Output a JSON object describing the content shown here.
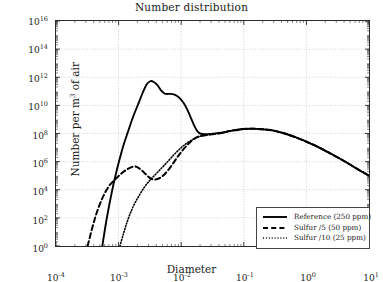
{
  "chart_data": {
    "type": "line",
    "title": "Number distribution",
    "xlabel": "Diameter",
    "ylabel_prefix": "Number per m",
    "ylabel_exponent": "3",
    "ylabel_suffix": " of air",
    "xscale": "log",
    "yscale": "log",
    "xlim": [
      0.0001,
      10
    ],
    "ylim": [
      1,
      1e+16
    ],
    "grid": true,
    "legend_position": "lower right",
    "xticks": [
      {
        "value": 0.0001,
        "mantissa": "10",
        "exponent": "-4"
      },
      {
        "value": 0.001,
        "mantissa": "10",
        "exponent": "-3"
      },
      {
        "value": 0.01,
        "mantissa": "10",
        "exponent": "-2"
      },
      {
        "value": 0.1,
        "mantissa": "10",
        "exponent": "-1"
      },
      {
        "value": 1,
        "mantissa": "10",
        "exponent": "0"
      },
      {
        "value": 10,
        "mantissa": "10",
        "exponent": "1"
      }
    ],
    "yticks": [
      {
        "value": 1,
        "mantissa": "10",
        "exponent": "0"
      },
      {
        "value": 100,
        "mantissa": "10",
        "exponent": "2"
      },
      {
        "value": 10000,
        "mantissa": "10",
        "exponent": "4"
      },
      {
        "value": 1000000.0,
        "mantissa": "10",
        "exponent": "6"
      },
      {
        "value": 100000000.0,
        "mantissa": "10",
        "exponent": "8"
      },
      {
        "value": 10000000000.0,
        "mantissa": "10",
        "exponent": "10"
      },
      {
        "value": 1000000000000.0,
        "mantissa": "10",
        "exponent": "12"
      },
      {
        "value": 100000000000000.0,
        "mantissa": "10",
        "exponent": "14"
      },
      {
        "value": 1e+16,
        "mantissa": "10",
        "exponent": "16"
      }
    ],
    "series": [
      {
        "name": "Reference (250 ppm)",
        "style": "solid",
        "color": "#000000",
        "x": [
          0.00055,
          0.00062,
          0.0007,
          0.0008,
          0.0009,
          0.001,
          0.0012,
          0.0014,
          0.0017,
          0.002,
          0.0024,
          0.0028,
          0.0032,
          0.0036,
          0.0042,
          0.0048,
          0.0054,
          0.006,
          0.0068,
          0.0076,
          0.0086,
          0.0096,
          0.011,
          0.0125,
          0.014,
          0.016,
          0.018,
          0.02,
          0.024,
          0.03,
          0.04,
          0.055,
          0.075,
          0.1,
          0.14,
          0.2,
          0.3,
          0.45,
          0.7,
          1.0,
          1.6,
          2.5,
          4.0,
          6.5,
          10.0
        ],
        "y": [
          1.0,
          30.0,
          600.0,
          12000.0,
          120000.0,
          800000.0,
          15000000.0,
          120000000.0,
          1500000000.0,
          9000000000.0,
          70000000000.0,
          300000000000.0,
          520000000000.0,
          480000000000.0,
          260000000000.0,
          110000000000.0,
          70000000000.0,
          65000000000.0,
          66000000000.0,
          60000000000.0,
          46000000000.0,
          30000000000.0,
          14000000000.0,
          5000000000.0,
          1600000000.0,
          400000000.0,
          150000000.0,
          100000000.0,
          90000000.0,
          95000000.0,
          110000000.0,
          140000000.0,
          180000000.0,
          210000000.0,
          220000000.0,
          200000000.0,
          160000000.0,
          100000000.0,
          50000000.0,
          26000000.0,
          10000000.0,
          3500000.0,
          1100000.0,
          300000.0,
          100000.0
        ]
      },
      {
        "name": "Sulfur /5 (50 ppm)",
        "style": "dashed",
        "color": "#000000",
        "x": [
          0.00032,
          0.00038,
          0.00045,
          0.00055,
          0.0007,
          0.0009,
          0.0011,
          0.0014,
          0.0018,
          0.0022,
          0.0027,
          0.0033,
          0.004,
          0.005,
          0.0062,
          0.0075,
          0.009,
          0.011,
          0.014,
          0.018,
          0.024,
          0.032,
          0.045,
          0.06,
          0.08,
          0.1,
          0.14,
          0.2,
          0.3,
          0.45,
          0.7,
          1.0,
          1.6,
          2.5,
          4.0,
          6.5,
          10.0
        ],
        "y": [
          1.0,
          20.0,
          250.0,
          2500.0,
          18000.0,
          60000.0,
          140000.0,
          300000.0,
          450000.0,
          300000.0,
          130000.0,
          60000.0,
          55000.0,
          90000.0,
          250000.0,
          800000.0,
          2600000.0,
          8000000.0,
          25000000.0,
          55000000.0,
          75000000.0,
          90000000.0,
          110000000.0,
          150000000.0,
          180000000.0,
          210000000.0,
          220000000.0,
          200000000.0,
          160000000.0,
          100000000.0,
          50000000.0,
          26000000.0,
          10000000.0,
          3500000.0,
          1100000.0,
          300000.0,
          100000.0
        ]
      },
      {
        "name": "Sulfur /10 (25 ppm)",
        "style": "dotted",
        "color": "#000000",
        "x": [
          0.00105,
          0.0012,
          0.0014,
          0.0017,
          0.0021,
          0.0026,
          0.0032,
          0.004,
          0.005,
          0.0062,
          0.0076,
          0.0092,
          0.011,
          0.014,
          0.018,
          0.024,
          0.032,
          0.045,
          0.06,
          0.08,
          0.1,
          0.14,
          0.2,
          0.3,
          0.45,
          0.7,
          1.0,
          1.6,
          2.5,
          4.0,
          6.5,
          10.0
        ],
        "y": [
          1.0,
          8.0,
          70.0,
          600.0,
          3500.0,
          16000.0,
          50000.0,
          140000.0,
          400000.0,
          1100000.0,
          3000000.0,
          7000000.0,
          14000000.0,
          30000000.0,
          55000000.0,
          75000000.0,
          90000000.0,
          110000000.0,
          150000000.0,
          180000000.0,
          210000000.0,
          220000000.0,
          200000000.0,
          160000000.0,
          100000000.0,
          50000000.0,
          26000000.0,
          10000000.0,
          3500000.0,
          1100000.0,
          300000.0,
          100000.0
        ]
      }
    ]
  }
}
